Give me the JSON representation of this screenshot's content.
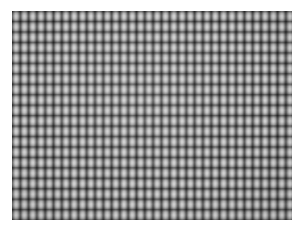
{
  "image": {
    "kind": "texture-pattern",
    "description": "Grayscale woven grid texture",
    "canvas_width": 305,
    "canvas_height": 241,
    "background_color": "#ffffff"
  },
  "texture": {
    "name": "grid-weave-texture",
    "left": 12,
    "top": 11,
    "width": 280,
    "height": 209,
    "columns": 34,
    "rows": 20,
    "cell_width": 8.3,
    "cell_height": 10.45,
    "cell_highlight_color": "#cfcfcf",
    "cell_midtone_color": "#a9a9a9",
    "gridline_color": "#4f4f4f",
    "seam_color": "#6e6e6e",
    "base_color": "#9a9a9a"
  }
}
